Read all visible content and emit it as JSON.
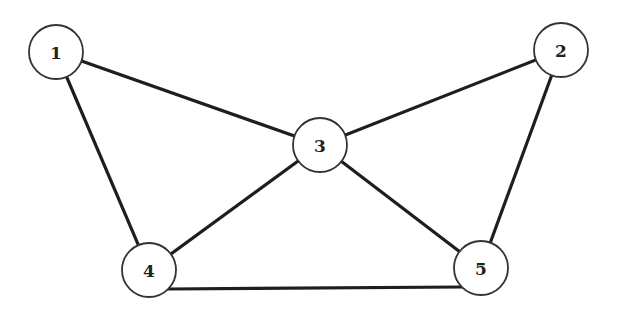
{
  "graph": {
    "nodes": [
      {
        "id": "1",
        "label": "1",
        "x": 56,
        "y": 52
      },
      {
        "id": "2",
        "label": "2",
        "x": 561,
        "y": 50
      },
      {
        "id": "3",
        "label": "3",
        "x": 320,
        "y": 145
      },
      {
        "id": "4",
        "label": "4",
        "x": 149,
        "y": 270
      },
      {
        "id": "5",
        "label": "5",
        "x": 481,
        "y": 268
      }
    ],
    "edges": [
      {
        "from": "1",
        "to": "3"
      },
      {
        "from": "1",
        "to": "4"
      },
      {
        "from": "2",
        "to": "3"
      },
      {
        "from": "2",
        "to": "5"
      },
      {
        "from": "3",
        "to": "4"
      },
      {
        "from": "3",
        "to": "5"
      },
      {
        "from": "4",
        "to": "5"
      }
    ],
    "node_radius": 27
  }
}
